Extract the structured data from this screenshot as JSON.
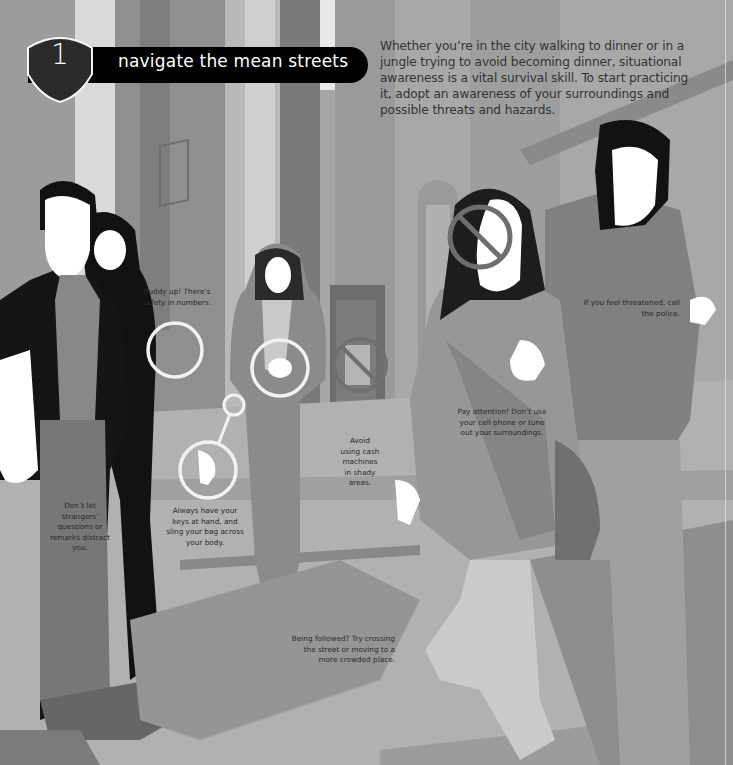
{
  "section": {
    "number": "1",
    "title": "navigate the mean streets",
    "badge_color": "#2a2a2a",
    "bar_color": "#000000"
  },
  "intro": {
    "text": "Whether you’re in the city walking to dinner or in a jungle trying to avoid becoming dinner, situational awareness is a vital survival skill. To start practicing it, adopt an awareness of your surroundings and possible threats and hazards."
  },
  "tips": [
    {
      "id": "buddy-up",
      "text": "Buddy up! There’s safety in numbers."
    },
    {
      "id": "strangers",
      "text": "Don’t let strangers’ questions or remarks distract you."
    },
    {
      "id": "keys",
      "text": "Always have your keys at hand, and sling your bag across your body."
    },
    {
      "id": "cash-machines",
      "text": "Avoid using cash machines in shady areas."
    },
    {
      "id": "pay-attention",
      "text": "Pay attention! Don’t use your cell phone or tune out your surroundings."
    },
    {
      "id": "police",
      "text": "If you feel threatened, call the police."
    },
    {
      "id": "followed",
      "text": "Being followed? Try crossing the street or moving to a more crowded place."
    }
  ],
  "icons": {
    "callout": "callout-ring-icon",
    "prohibited": "no-symbol-icon"
  },
  "colors": {
    "background": "#a3a3a3",
    "silhouette_dark": "#111111",
    "text": "#2a2a2a",
    "ring": "#f2f2f2",
    "no_symbol": "#6e6e6e"
  }
}
